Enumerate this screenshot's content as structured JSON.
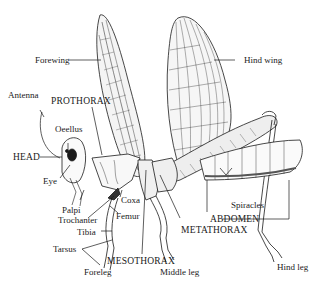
{
  "diagram": {
    "labels": {
      "forewing": "Forewing",
      "hind_wing": "Hind wing",
      "antenna": "Antenna",
      "prothorax": "PROTHORAX",
      "oeellus": "Oeellus",
      "head": "HEAD",
      "eye": "Eye",
      "palpi": "Palpi",
      "trochanter": "Trochanter",
      "coxa": "Coxa",
      "femur": "Femur",
      "tibia": "Tibia",
      "tarsus": "Tarsus",
      "foreleg": "Foreleg",
      "mesothorax": "MESOTHORAX",
      "middle_leg": "Middle leg",
      "metathorax": "METATHORAX",
      "spiracles": "Spiracles",
      "abdomen": "ABDOMEN",
      "hind_leg": "Hind leg"
    },
    "colors": {
      "ink": "#1a1a1a",
      "background": "#ffffff",
      "shade": "#9a9a9a"
    }
  }
}
